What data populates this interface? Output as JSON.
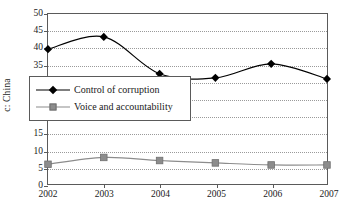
{
  "chart_data": {
    "type": "line",
    "title": "",
    "xlabel": "",
    "ylabel": "c: China",
    "categories": [
      "2002",
      "2003",
      "2004",
      "2005",
      "2006",
      "2007"
    ],
    "x": [
      2002,
      2003,
      2004,
      2005,
      2006,
      2007
    ],
    "xlim": [
      2002,
      2007
    ],
    "ylim": [
      0,
      50
    ],
    "yticks": [
      0,
      5,
      10,
      15,
      20,
      25,
      30,
      35,
      40,
      45,
      50
    ],
    "ytick_labels": [
      "0",
      "5",
      "10",
      "15",
      "20",
      "25",
      "30",
      "35",
      "40",
      "45",
      "50"
    ],
    "grid": "horizontal-dotted",
    "legend_position": "inside-center-left",
    "series": [
      {
        "name": "Control of corruption",
        "marker": "diamond",
        "color": "#000000",
        "values": [
          39.7,
          43.3,
          32.5,
          31.3,
          35.4,
          31.0
        ]
      },
      {
        "name": "Voice and accountability",
        "marker": "square",
        "color": "#8c8c8c",
        "values": [
          6.0,
          8.0,
          7.1,
          6.4,
          5.8,
          5.8
        ]
      }
    ]
  },
  "legend": {
    "items": [
      {
        "label": "Control of corruption",
        "marker": "diamond-marker-icon"
      },
      {
        "label": "Voice and accountability",
        "marker": "square-marker-icon"
      }
    ]
  },
  "axes": {
    "y_title": "c: China"
  }
}
